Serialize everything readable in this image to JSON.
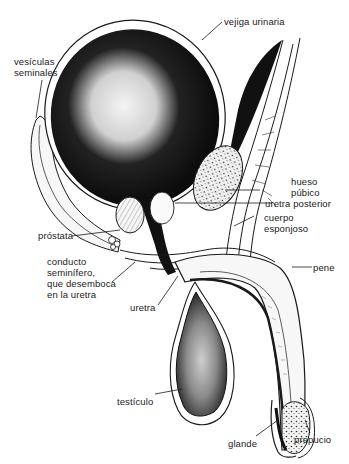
{
  "diagram": {
    "title": "",
    "labels": {
      "vejiga": "vejiga urinaria",
      "vesiculas_1": "vesículas",
      "vesiculas_2": "seminales",
      "hueso_1": "hueso",
      "hueso_2": "púbico",
      "uretra_posterior": "uretra posterior",
      "cuerpo_1": "cuerpo",
      "cuerpo_2": "esponjoso",
      "prostata": "próstata",
      "conducto_1": "conducto",
      "conducto_2": "seminífero,",
      "conducto_3": "que desemboca",
      "conducto_4": "en la uretra",
      "pene": "pene",
      "uretra": "uretra",
      "testiculo": "testículo",
      "glande": "glande",
      "prepucio": "prepucio"
    },
    "colors": {
      "ink": "#1a1a1a",
      "background": "#ffffff",
      "fill_dark": "#111111",
      "fill_mid": "#d8d8d8"
    }
  }
}
